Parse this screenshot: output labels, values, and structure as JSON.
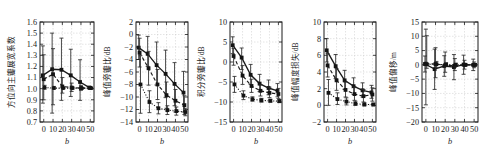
{
  "figure": {
    "background": "#ffffff",
    "ink_color": "#1a1a1a",
    "grid_color": "#c8c8c8",
    "panel_count": 5
  },
  "chart_data": [
    {
      "type": "line",
      "title": "",
      "xlabel": "b",
      "ylabel": "方位向主瓣展宽系数",
      "x": [
        0,
        10,
        20,
        30,
        40,
        50
      ],
      "xticklabels": [
        "0",
        "10",
        "20",
        "30",
        "40",
        "50"
      ],
      "xlim": [
        -4,
        54
      ],
      "ylim": [
        0.7,
        1.6
      ],
      "yticks": [
        0.7,
        0.8,
        0.9,
        1.0,
        1.1,
        1.2,
        1.3,
        1.4,
        1.5,
        1.6
      ],
      "yticklabels": [
        "0.7",
        "0.8",
        "0.9",
        "1.0",
        "1.1",
        "1.2",
        "1.3",
        "1.4",
        "1.5",
        "1.6"
      ],
      "grid": true,
      "legend": "none",
      "series": [
        {
          "name": "solid",
          "style": "solid",
          "marker": "square",
          "values": [
            1.12,
            1.175,
            1.17,
            1.12,
            1.06,
            1.01
          ],
          "err_low": [
            0.87,
            0.78,
            0.895,
            0.93,
            0.895,
            1.0
          ],
          "err_high": [
            1.385,
            1.5,
            1.455,
            1.355,
            1.26,
            1.02
          ]
        },
        {
          "name": "dashed",
          "style": "dashed",
          "marker": "square",
          "values": [
            1.085,
            1.13,
            1.02,
            1.01,
            1.005,
            1.005
          ],
          "err_low": [
            0.9,
            0.855,
            0.96,
            0.975,
            0.985,
            0.995
          ],
          "err_high": [
            1.305,
            1.36,
            1.1,
            1.05,
            1.03,
            1.015
          ]
        },
        {
          "name": "dotted",
          "style": "dotted",
          "marker": "circle",
          "values": [
            1.01,
            1.005,
            1.005,
            1.005,
            1.005,
            1.005
          ],
          "err_low": [
            0.995,
            0.995,
            0.995,
            0.995,
            0.995,
            0.995
          ],
          "err_high": [
            1.03,
            1.02,
            1.015,
            1.015,
            1.01,
            1.01
          ]
        }
      ]
    },
    {
      "type": "line",
      "title": "",
      "xlabel": "b",
      "ylabel": "峰值旁瓣比/dB",
      "x": [
        0,
        10,
        20,
        30,
        40,
        50
      ],
      "xticklabels": [
        "0",
        "10",
        "20",
        "30",
        "40",
        "50"
      ],
      "xlim": [
        -4,
        54
      ],
      "ylim": [
        -14,
        2
      ],
      "yticks": [
        -14,
        -12,
        -10,
        -8,
        -6,
        -4,
        -2,
        0,
        2
      ],
      "yticklabels": [
        "-14",
        "-12",
        "-10",
        "-8",
        "-6",
        "-4",
        "-2",
        "0",
        "2"
      ],
      "grid": true,
      "legend": "none",
      "series": [
        {
          "name": "solid",
          "style": "solid",
          "marker": "square",
          "values": [
            -2.1,
            -3.1,
            -4.9,
            -6.3,
            -7.9,
            -9.3
          ],
          "err_low": [
            -4.0,
            -5.1,
            -8.1,
            -10.1,
            -11.4,
            -12.4
          ],
          "err_high": [
            -0.1,
            -0.3,
            -1.2,
            -2.5,
            -4.5,
            -5.9
          ]
        },
        {
          "name": "dashed",
          "style": "dashed",
          "marker": "square",
          "values": [
            -2.9,
            -5.4,
            -8.0,
            -9.7,
            -10.6,
            -11.3
          ],
          "err_low": [
            -5.2,
            -8.1,
            -10.4,
            -11.8,
            -12.4,
            -12.8
          ],
          "err_high": [
            -0.6,
            -2.7,
            -5.6,
            -7.6,
            -8.8,
            -9.8
          ]
        },
        {
          "name": "dotted",
          "style": "dotted",
          "marker": "square",
          "values": [
            -8.0,
            -10.8,
            -11.8,
            -12.1,
            -12.25,
            -12.4
          ],
          "err_low": [
            -12.6,
            -12.5,
            -12.7,
            -12.8,
            -12.9,
            -13.0
          ],
          "err_high": [
            -3.4,
            -9.0,
            -10.9,
            -11.4,
            -11.6,
            -11.8
          ]
        }
      ]
    },
    {
      "type": "line",
      "title": "",
      "xlabel": "b",
      "ylabel": "积分旁瓣比/dB",
      "x": [
        0,
        10,
        20,
        30,
        40,
        50
      ],
      "xticklabels": [
        "0",
        "10",
        "20",
        "30",
        "40",
        "50"
      ],
      "xlim": [
        -4,
        54
      ],
      "ylim": [
        -15,
        10
      ],
      "yticks": [
        -15,
        -10,
        -5,
        0,
        5,
        10
      ],
      "yticklabels": [
        "-15",
        "-10",
        "-5",
        "0",
        "5",
        "10"
      ],
      "grid": true,
      "legend": "none",
      "series": [
        {
          "name": "solid",
          "style": "solid",
          "marker": "square",
          "values": [
            4.2,
            1.1,
            -3.2,
            -5.4,
            -6.5,
            -7.2
          ],
          "err_low": [
            2.1,
            -1.9,
            -5.6,
            -7.4,
            -8.2,
            -8.7
          ],
          "err_high": [
            6.3,
            3.5,
            -0.6,
            -3.1,
            -4.5,
            -5.4
          ]
        },
        {
          "name": "dashed",
          "style": "dashed",
          "marker": "square",
          "values": [
            1.5,
            -3.4,
            -6.0,
            -7.2,
            -7.7,
            -8.0
          ],
          "err_low": [
            -0.8,
            -5.6,
            -7.6,
            -8.5,
            -8.9,
            -9.1
          ],
          "err_high": [
            3.4,
            -0.9,
            -4.3,
            -5.7,
            -6.3,
            -6.6
          ]
        },
        {
          "name": "dotted",
          "style": "dotted",
          "marker": "square",
          "values": [
            -5.6,
            -8.4,
            -9.3,
            -9.6,
            -9.7,
            -9.8
          ],
          "err_low": [
            -7.6,
            -9.4,
            -9.8,
            -10.0,
            -10.0,
            -10.1
          ],
          "err_high": [
            -3.6,
            -7.2,
            -8.7,
            -9.1,
            -9.3,
            -9.4
          ]
        }
      ]
    },
    {
      "type": "line",
      "title": "",
      "xlabel": "b",
      "ylabel": "峰值幅度损失/dB",
      "x": [
        0,
        10,
        20,
        30,
        40,
        50
      ],
      "xticklabels": [
        "0",
        "10",
        "20",
        "30",
        "40",
        "50"
      ],
      "xlim": [
        -4,
        54
      ],
      "ylim": [
        -2,
        10
      ],
      "yticks": [
        -2,
        0,
        2,
        4,
        6,
        8,
        10
      ],
      "yticklabels": [
        "-2",
        "0",
        "2",
        "4",
        "6",
        "8",
        "10"
      ],
      "grid": true,
      "legend": "none",
      "series": [
        {
          "name": "solid",
          "style": "solid",
          "marker": "square",
          "values": [
            6.6,
            4.7,
            3.0,
            2.3,
            1.8,
            1.55
          ],
          "err_low": [
            5.2,
            3.2,
            1.9,
            1.3,
            1.0,
            0.85
          ],
          "err_high": [
            8.0,
            6.1,
            4.2,
            3.3,
            2.7,
            2.4
          ]
        },
        {
          "name": "dashed",
          "style": "dashed",
          "marker": "square",
          "values": [
            4.8,
            3.0,
            1.85,
            1.35,
            1.1,
            1.3
          ],
          "err_low": [
            3.4,
            1.8,
            1.0,
            0.6,
            0.4,
            0.5
          ],
          "err_high": [
            6.2,
            4.4,
            2.8,
            2.2,
            1.9,
            2.1
          ]
        },
        {
          "name": "dotted",
          "style": "dotted",
          "marker": "square",
          "values": [
            1.5,
            0.75,
            0.45,
            0.2,
            0.1,
            0.1
          ],
          "err_low": [
            0.0,
            0.1,
            0.05,
            0.0,
            -0.05,
            -0.05
          ],
          "err_high": [
            3.1,
            1.5,
            0.9,
            0.5,
            0.3,
            0.25
          ]
        }
      ]
    },
    {
      "type": "line",
      "title": "",
      "xlabel": "b",
      "ylabel": "峰值偏移/m",
      "x": [
        0,
        10,
        20,
        30,
        40,
        50
      ],
      "xticklabels": [
        "0",
        "10",
        "20",
        "30",
        "40",
        "50"
      ],
      "xlim": [
        -4,
        54
      ],
      "ylim": [
        -20,
        15
      ],
      "yticks": [
        -20,
        -15,
        -10,
        -5,
        0,
        5,
        10,
        15
      ],
      "yticklabels": [
        "-20",
        "-15",
        "-10",
        "-5",
        "0",
        "5",
        "10",
        "15"
      ],
      "grid": true,
      "legend": "none",
      "series": [
        {
          "name": "solid",
          "style": "solid",
          "marker": "square",
          "values": [
            0.3,
            -1.5,
            -0.4,
            -0.8,
            0.1,
            0.0
          ],
          "err_low": [
            -2.5,
            -8.6,
            -4.0,
            -5.2,
            -3.3,
            -2.0
          ],
          "err_high": [
            3.1,
            5.5,
            3.2,
            3.6,
            3.4,
            2.0
          ]
        },
        {
          "name": "dashed",
          "style": "dashed",
          "marker": "square",
          "values": [
            0.4,
            0.3,
            -0.1,
            -0.3,
            0.0,
            0.0
          ],
          "err_low": [
            -14.0,
            -4.5,
            -2.6,
            -2.0,
            -1.5,
            -1.0
          ],
          "err_high": [
            12.5,
            6.0,
            4.5,
            2.2,
            1.6,
            1.0
          ]
        },
        {
          "name": "dotted",
          "style": "dotted",
          "marker": "square",
          "values": [
            0.2,
            0.2,
            0.0,
            0.0,
            0.0,
            0.0
          ],
          "err_low": [
            -1.2,
            -1.0,
            -0.6,
            -0.5,
            -0.4,
            -0.3
          ],
          "err_high": [
            10.2,
            1.2,
            0.8,
            0.6,
            0.5,
            0.4
          ]
        }
      ]
    }
  ]
}
